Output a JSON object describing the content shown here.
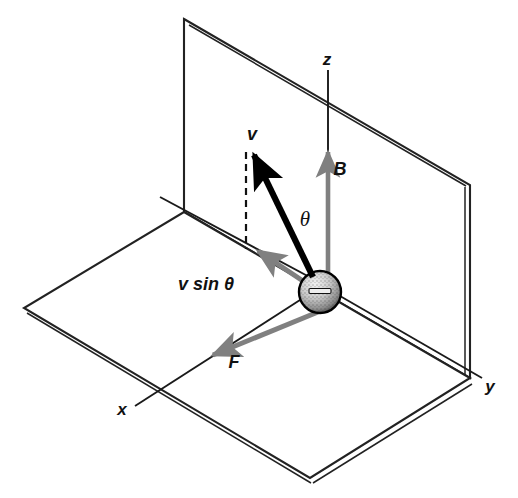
{
  "figure": {
    "background_color": "#ffffff",
    "width": 518,
    "height": 498
  },
  "colors": {
    "ink": "#1a1a1a",
    "plane_edge": "#222222",
    "vector_gray": "#808080",
    "vector_black": "#000000",
    "dashed": "#111111",
    "particle_outline": "#000000",
    "particle_fill": "#d8d8d8"
  },
  "axes": [
    {
      "name": "z-axis",
      "label": "z",
      "label_x": 327,
      "label_y": 65,
      "direction": "up"
    },
    {
      "name": "y-axis",
      "label": "y",
      "label_x": 490,
      "label_y": 392,
      "direction": "right-down"
    },
    {
      "name": "x-axis",
      "label": "x",
      "label_x": 122,
      "label_y": 415,
      "direction": "left-down"
    }
  ],
  "vectors": [
    {
      "name": "velocity",
      "label": "v",
      "label_x": 252,
      "label_y": 140,
      "style": "thick-black",
      "color": "#000000",
      "from_x": 313,
      "from_y": 277,
      "to_x": 249,
      "to_y": 146
    },
    {
      "name": "magnetic-field",
      "label": "B",
      "label_x": 340,
      "label_y": 175,
      "style": "gray",
      "color": "#808080",
      "from_x": 328,
      "from_y": 272,
      "to_x": 328,
      "to_y": 150
    },
    {
      "name": "force",
      "label": "F",
      "label_x": 234,
      "label_y": 368,
      "style": "gray",
      "color": "#808080",
      "from_x": 318,
      "from_y": 312,
      "to_x": 207,
      "to_y": 358
    },
    {
      "name": "velocity-perpendicular-component",
      "label": "v sin θ",
      "label_x": 178,
      "label_y": 290,
      "style": "gray",
      "color": "#808080",
      "from_x": 305,
      "from_y": 282,
      "to_x": 251,
      "to_y": 248
    }
  ],
  "annotations": [
    {
      "name": "theta-angle",
      "label": "θ",
      "label_x": 305,
      "label_y": 226,
      "description": "angle between velocity vector and magnetic field"
    },
    {
      "name": "projection-dashed-line",
      "label": "",
      "from_x": 246,
      "from_y": 150,
      "to_x": 246,
      "to_y": 249,
      "description": "dashed projection from tip of v down to tip of v sin theta"
    }
  ],
  "particle": {
    "name": "negative-charge-particle",
    "sign": "−",
    "cx": 320,
    "cy": 292,
    "r": 21
  },
  "planes": [
    {
      "name": "vertical-plane",
      "description": "y-z plane drawn as a thin slab",
      "points": "184,19 470,185 470,378 184,212"
    },
    {
      "name": "horizontal-plane",
      "description": "x-y ground plane drawn as a thin slab",
      "points": "184,212 470,378 310,478 24,308"
    }
  ]
}
